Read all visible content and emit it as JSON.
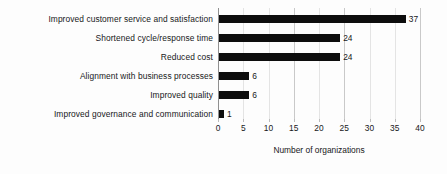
{
  "chart_data": {
    "type": "bar",
    "orientation": "horizontal",
    "title": "",
    "subtitle": "",
    "xlabel": "Number of organizations",
    "ylabel": "",
    "xlim": [
      0,
      40
    ],
    "xticks": [
      0,
      5,
      10,
      15,
      20,
      25,
      30,
      35,
      40
    ],
    "xtick_labels": [
      "0",
      "5",
      "10",
      "15",
      "20",
      "25",
      "30",
      "35",
      "40"
    ],
    "grid": true,
    "gridlines_at": [
      0,
      15,
      25,
      40
    ],
    "legend": null,
    "legend_position": "none",
    "bar_color": "#0d0d0d",
    "categories": [
      "Improved customer service and satisfaction",
      "Shortened cycle/response time",
      "Reduced cost",
      "Alignment with business processes",
      "Improved quality",
      "Improved governance and communication"
    ],
    "values": [
      37,
      24,
      24,
      6,
      6,
      1
    ],
    "value_labels": [
      "37",
      "24",
      "24",
      "6",
      "6",
      "1"
    ]
  }
}
